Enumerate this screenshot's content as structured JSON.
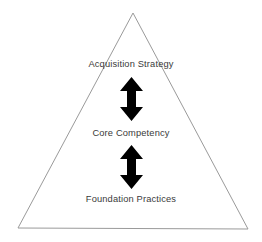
{
  "diagram": {
    "type": "pyramid-hierarchy",
    "background_color": "#ffffff",
    "shape": {
      "name": "triangle",
      "outline_color": "#9a9a9a",
      "fill_color": "none",
      "stroke_width": 1,
      "apex": {
        "x": 133,
        "y": 13
      },
      "base_left": {
        "x": 18,
        "y": 228
      },
      "base_right": {
        "x": 248,
        "y": 229
      }
    },
    "tiers": [
      {
        "id": "acquisition-strategy",
        "label": "Acquisition Strategy",
        "level": 1
      },
      {
        "id": "core-competency",
        "label": "Core Competency",
        "level": 2
      },
      {
        "id": "foundation-practices",
        "label": "Foundation Practices",
        "level": 3
      }
    ],
    "connectors": [
      {
        "id": "connector-strategy-competency",
        "icon": "double-headed-vertical-arrow",
        "color": "#000000",
        "from": "acquisition-strategy",
        "to": "core-competency"
      },
      {
        "id": "connector-competency-practices",
        "icon": "double-headed-vertical-arrow",
        "color": "#000000",
        "from": "core-competency",
        "to": "foundation-practices"
      }
    ],
    "text_color": "#3a3a3a"
  }
}
